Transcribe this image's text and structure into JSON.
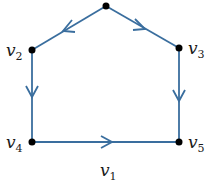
{
  "diagram": {
    "type": "directed-graph",
    "edge_color": "#3a6e9e",
    "node_color": "#000000",
    "nodes": [
      {
        "id": "top",
        "label": "",
        "x": 106,
        "y": 6
      },
      {
        "id": "v2",
        "label": "v",
        "sub": "2",
        "x": 32,
        "y": 50
      },
      {
        "id": "v3",
        "label": "v",
        "sub": "3",
        "x": 179,
        "y": 48
      },
      {
        "id": "v4",
        "label": "v",
        "sub": "4",
        "x": 32,
        "y": 142
      },
      {
        "id": "v5",
        "label": "v",
        "sub": "5",
        "x": 179,
        "y": 142
      }
    ],
    "edges": [
      {
        "from": "top",
        "to": "v2"
      },
      {
        "from": "top",
        "to": "v3"
      },
      {
        "from": "v2",
        "to": "v4"
      },
      {
        "from": "v3",
        "to": "v5"
      },
      {
        "from": "v4",
        "to": "v5"
      }
    ],
    "caption": {
      "label": "v",
      "sub": "1"
    }
  }
}
